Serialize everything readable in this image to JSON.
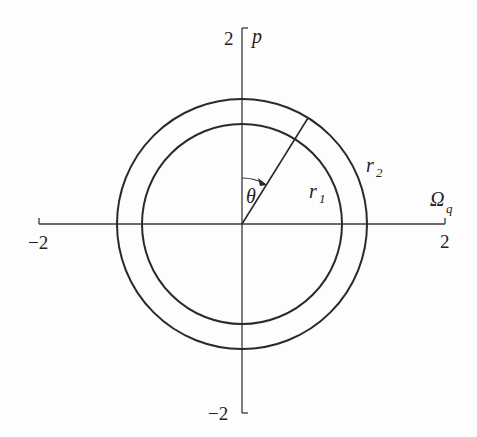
{
  "diagram": {
    "axes": {
      "x_label": "Ω",
      "x_label_subscript": "q",
      "y_label": "p",
      "x_min_label": "−2",
      "x_max_label": "2",
      "y_min_label": "−2",
      "y_max_label": "2"
    },
    "circles": [
      {
        "name": "inner",
        "label": "r",
        "label_subscript": "1",
        "radius_units": 1.6
      },
      {
        "name": "outer",
        "label": "r",
        "label_subscript": "2",
        "radius_units": 2.0
      }
    ],
    "angle": {
      "label": "θ",
      "description": "angle measured clockwise from p-axis to radial line",
      "degrees_approx": 32
    },
    "colors": {
      "line": "#2a2a2a",
      "background": "#fdfdfd"
    }
  }
}
